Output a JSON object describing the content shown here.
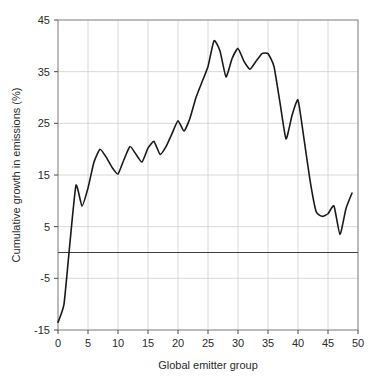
{
  "chart_data": {
    "type": "line",
    "title": "",
    "xlabel": "Global emitter group",
    "ylabel": "Cumulative growth in emissions (%)",
    "xlim": [
      0,
      50
    ],
    "ylim": [
      -15,
      45
    ],
    "xticks": [
      0,
      5,
      10,
      15,
      20,
      25,
      30,
      35,
      40,
      45,
      50
    ],
    "xticklabels": [
      "0",
      "5",
      "10",
      "15",
      "20",
      "25",
      "30",
      "35",
      "40",
      "45",
      "50"
    ],
    "yticks": [
      -15,
      -5,
      5,
      15,
      25,
      35,
      45
    ],
    "yticklabels": [
      "-15",
      "-5",
      "5",
      "15",
      "25",
      "35",
      "45"
    ],
    "grid": true,
    "legend": "none",
    "reference_lines": [
      {
        "orientation": "horizontal",
        "value": 0,
        "color": "#3f3f3f"
      }
    ],
    "series": [
      {
        "name": "Cumulative growth in emissions",
        "color": "#1a1a1a",
        "linewidth": 1.6,
        "x": [
          0,
          1,
          2,
          3,
          4,
          5,
          6,
          7,
          8,
          9,
          10,
          11,
          12,
          13,
          14,
          15,
          16,
          17,
          18,
          19,
          20,
          21,
          22,
          23,
          24,
          25,
          26,
          27,
          28,
          29,
          30,
          31,
          32,
          33,
          34,
          35,
          36,
          37,
          38,
          39,
          40,
          41,
          42,
          43,
          44,
          45,
          46,
          47,
          48,
          49
        ],
        "y": [
          -13.5,
          -10.0,
          2.0,
          13.0,
          9.0,
          12.5,
          17.5,
          20.0,
          18.5,
          16.5,
          15.2,
          18.0,
          20.5,
          19.0,
          17.5,
          20.2,
          21.5,
          19.0,
          20.5,
          23.0,
          25.5,
          23.5,
          26.0,
          30.0,
          33.0,
          36.0,
          41.0,
          39.0,
          34.0,
          37.5,
          39.5,
          37.0,
          35.5,
          37.0,
          38.5,
          38.5,
          36.0,
          29.0,
          22.0,
          26.5,
          29.5,
          22.0,
          14.0,
          8.0,
          7.0,
          7.5,
          9.0,
          3.5,
          8.5,
          11.5
        ]
      }
    ]
  },
  "axes": {
    "plot_left": 58,
    "plot_top": 20,
    "plot_right": 358,
    "plot_bottom": 330
  }
}
